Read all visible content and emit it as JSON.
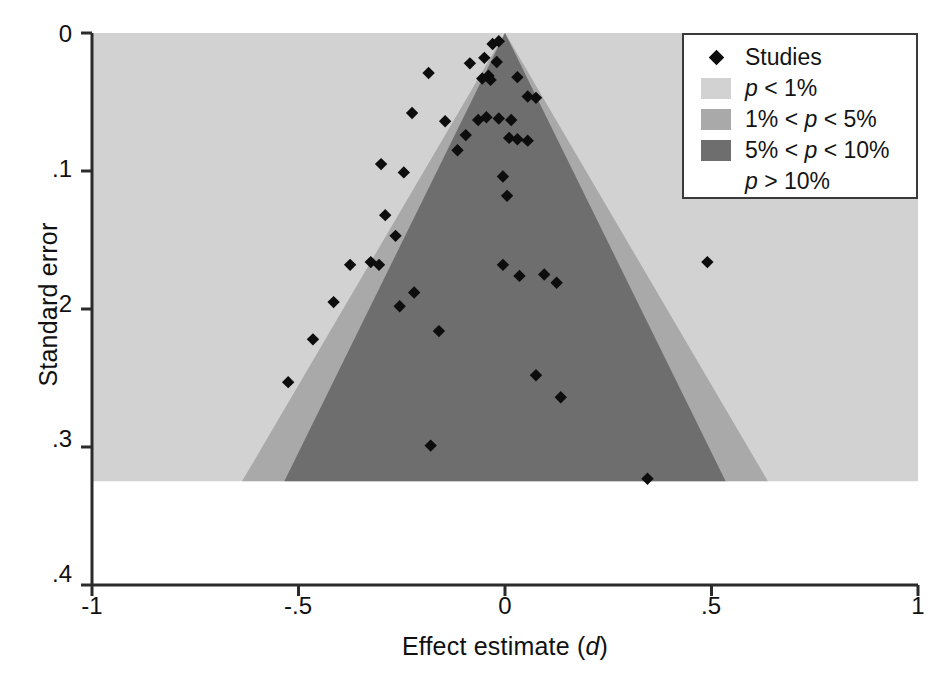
{
  "chart_data": {
    "type": "scatter",
    "title": "",
    "xlabel": "Effect estimate (d)",
    "ylabel": "Standard error",
    "xlim": [
      -1,
      1
    ],
    "ylim": [
      0,
      0.4
    ],
    "y_inverted": true,
    "grid": false,
    "xticks": [
      "-1",
      "-.5",
      "0",
      ".5",
      "1"
    ],
    "xtick_values": [
      -1,
      -0.5,
      0,
      0.5,
      1
    ],
    "yticks": [
      "0",
      ".1",
      ".2",
      ".3",
      ".4"
    ],
    "ytick_values": [
      0,
      0.1,
      0.2,
      0.3,
      0.4
    ],
    "legend_position": "top-right",
    "contour_apex": {
      "d": 0,
      "se": 0
    },
    "shaded_region_max_se": 0.325,
    "significance_bands": [
      {
        "label": "p < 1%",
        "color": "#d2d2d2",
        "z": 2.576
      },
      {
        "label": "1% < p < 5%",
        "color": "#a9a9a9",
        "z": 1.96
      },
      {
        "label": "5% < p < 10%",
        "color": "#6e6e6e",
        "z": 1.645
      },
      {
        "label": "p > 10%",
        "color": "#ffffff",
        "z": 0
      }
    ],
    "series": [
      {
        "name": "Studies",
        "marker": "diamond",
        "color": "#0d0d0d",
        "points": [
          {
            "d": -0.03,
            "se": 0.008
          },
          {
            "d": -0.015,
            "se": 0.006
          },
          {
            "d": -0.05,
            "se": 0.018
          },
          {
            "d": -0.085,
            "se": 0.022
          },
          {
            "d": -0.02,
            "se": 0.021
          },
          {
            "d": -0.04,
            "se": 0.031
          },
          {
            "d": -0.035,
            "se": 0.034
          },
          {
            "d": -0.055,
            "se": 0.033
          },
          {
            "d": 0.03,
            "se": 0.032
          },
          {
            "d": -0.185,
            "se": 0.029
          },
          {
            "d": 0.055,
            "se": 0.046
          },
          {
            "d": 0.075,
            "se": 0.047
          },
          {
            "d": -0.225,
            "se": 0.058
          },
          {
            "d": -0.145,
            "se": 0.064
          },
          {
            "d": -0.065,
            "se": 0.063
          },
          {
            "d": -0.045,
            "se": 0.061
          },
          {
            "d": -0.015,
            "se": 0.062
          },
          {
            "d": 0.015,
            "se": 0.063
          },
          {
            "d": -0.095,
            "se": 0.074
          },
          {
            "d": 0.01,
            "se": 0.076
          },
          {
            "d": 0.03,
            "se": 0.077
          },
          {
            "d": 0.055,
            "se": 0.078
          },
          {
            "d": -0.115,
            "se": 0.085
          },
          {
            "d": -0.3,
            "se": 0.095
          },
          {
            "d": -0.245,
            "se": 0.101
          },
          {
            "d": -0.005,
            "se": 0.104
          },
          {
            "d": 0.005,
            "se": 0.118
          },
          {
            "d": -0.29,
            "se": 0.132
          },
          {
            "d": -0.265,
            "se": 0.147
          },
          {
            "d": -0.325,
            "se": 0.166
          },
          {
            "d": -0.305,
            "se": 0.168
          },
          {
            "d": -0.375,
            "se": 0.168
          },
          {
            "d": 0.49,
            "se": 0.166
          },
          {
            "d": -0.005,
            "se": 0.168
          },
          {
            "d": 0.035,
            "se": 0.176
          },
          {
            "d": 0.095,
            "se": 0.175
          },
          {
            "d": 0.125,
            "se": 0.181
          },
          {
            "d": -0.415,
            "se": 0.195
          },
          {
            "d": -0.22,
            "se": 0.188
          },
          {
            "d": -0.255,
            "se": 0.198
          },
          {
            "d": -0.16,
            "se": 0.216
          },
          {
            "d": -0.465,
            "se": 0.222
          },
          {
            "d": -0.525,
            "se": 0.253
          },
          {
            "d": 0.075,
            "se": 0.248
          },
          {
            "d": 0.135,
            "se": 0.264
          },
          {
            "d": -0.18,
            "se": 0.299
          },
          {
            "d": 0.345,
            "se": 0.323
          }
        ]
      }
    ]
  },
  "axes": {
    "y_title": "Standard error",
    "x_title_prefix": "Effect estimate (",
    "x_title_italic": "d",
    "x_title_suffix": ")"
  },
  "legend": {
    "rows": [
      {
        "key": "marker",
        "label": "Studies",
        "color": "#0d0d0d"
      },
      {
        "key": "swatch",
        "label": "p < 1%",
        "color": "#d2d2d2",
        "italic_lead": "p",
        "rest": " < 1%"
      },
      {
        "key": "swatch",
        "label": "1% < p < 5%",
        "color": "#a9a9a9",
        "pre": "1% < ",
        "italic_mid": "p",
        "rest": " < 5%"
      },
      {
        "key": "swatch",
        "label": "5% < p < 10%",
        "color": "#6e6e6e",
        "pre": "5% < ",
        "italic_mid": "p",
        "rest": " < 10%"
      },
      {
        "key": "none",
        "label": "p > 10%",
        "color": "#ffffff",
        "italic_lead": "p",
        "rest": " > 10%"
      }
    ]
  },
  "colors": {
    "marker": "#0d0d0d",
    "band_p_lt_1": "#d2d2d2",
    "band_p_1_5": "#a9a9a9",
    "band_p_5_10": "#6e6e6e",
    "band_p_gt_10": "#ffffff",
    "axis": "#2b2b2b",
    "legend_border": "#3a3a3a"
  }
}
